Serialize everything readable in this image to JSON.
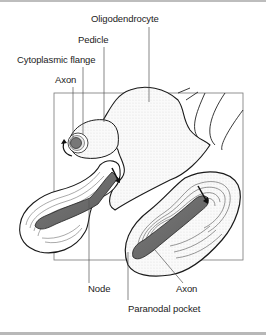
{
  "figure": {
    "type": "anatomical illustration",
    "labels": {
      "oligodendrocyte": "Oligodendrocyte",
      "pedicle": "Pedicle",
      "cytoplasmic_flange": "Cytoplasmic flange",
      "axon_top": "Axon",
      "node": "Node",
      "axon_bottom": "Axon",
      "paranodal_pocket": "Paranodal pocket"
    },
    "colors": {
      "axon_fill": "#6f6f6f",
      "outline": "#1a1a1a",
      "leader_line": "#555555",
      "frame": "#777777",
      "myelin_lines": "#444444"
    }
  }
}
